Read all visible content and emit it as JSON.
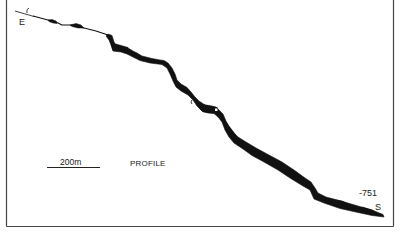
{
  "diagram": {
    "type": "cave-survey-profile",
    "title": "PROFILE",
    "scale_bar": {
      "label": "200m"
    },
    "entrance": {
      "label": "E",
      "marker": "C"
    },
    "sump": {
      "label": "S",
      "depth": "-751"
    },
    "colors": {
      "ink": "#111111",
      "frame": "#444444",
      "background": "#ffffff"
    },
    "profile_centerline": [
      [
        15,
        11
      ],
      [
        33,
        16
      ],
      [
        48,
        20
      ],
      [
        56,
        22
      ],
      [
        62,
        25
      ],
      [
        72,
        25
      ],
      [
        80,
        27
      ],
      [
        88,
        29
      ],
      [
        96,
        31
      ],
      [
        102,
        33
      ],
      [
        108,
        35
      ],
      [
        112,
        42
      ],
      [
        114,
        48
      ],
      [
        122,
        49
      ],
      [
        130,
        51
      ],
      [
        136,
        55
      ],
      [
        142,
        58
      ],
      [
        152,
        60
      ],
      [
        162,
        62
      ],
      [
        168,
        66
      ],
      [
        172,
        72
      ],
      [
        176,
        80
      ],
      [
        180,
        85
      ],
      [
        188,
        90
      ],
      [
        194,
        98
      ],
      [
        198,
        103
      ],
      [
        205,
        108
      ],
      [
        214,
        109
      ],
      [
        220,
        113
      ],
      [
        224,
        121
      ],
      [
        229,
        130
      ],
      [
        234,
        136
      ],
      [
        242,
        143
      ],
      [
        252,
        150
      ],
      [
        265,
        157
      ],
      [
        280,
        165
      ],
      [
        292,
        174
      ],
      [
        305,
        182
      ],
      [
        312,
        186
      ],
      [
        316,
        195
      ],
      [
        325,
        199
      ],
      [
        340,
        204
      ],
      [
        358,
        209
      ],
      [
        372,
        213
      ],
      [
        382,
        216
      ]
    ]
  }
}
